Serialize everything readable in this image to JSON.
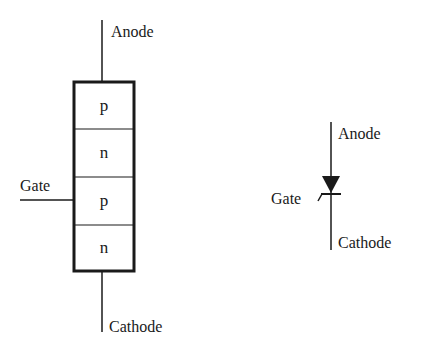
{
  "structure_diagram": {
    "labels": {
      "anode": "Anode",
      "cathode": "Cathode",
      "gate": "Gate"
    },
    "layers": [
      {
        "type": "p"
      },
      {
        "type": "n"
      },
      {
        "type": "p"
      },
      {
        "type": "n"
      }
    ]
  },
  "symbol_diagram": {
    "labels": {
      "anode": "Anode",
      "cathode": "Cathode",
      "gate": "Gate"
    },
    "icon": "thyristor-scr-symbol"
  },
  "colors": {
    "line": "#1a1a1a",
    "background": "#ffffff"
  }
}
